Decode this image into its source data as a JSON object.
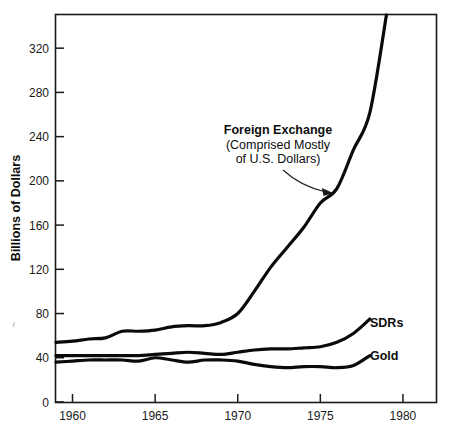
{
  "chart_data": {
    "type": "line",
    "title": "",
    "xlabel": "",
    "ylabel": "Billions of Dollars",
    "xlim": [
      1959,
      1982
    ],
    "ylim": [
      0,
      350
    ],
    "grid": false,
    "legend_position": "inline-right",
    "x_ticks": [
      "1960",
      "1965",
      "1970",
      "1975",
      "1980"
    ],
    "x_tick_values": [
      1960,
      1965,
      1970,
      1975,
      1980
    ],
    "y_ticks": [
      "0",
      "40",
      "80",
      "120",
      "160",
      "200",
      "240",
      "280",
      "320"
    ],
    "y_tick_values": [
      0,
      40,
      80,
      120,
      160,
      200,
      240,
      280,
      320
    ],
    "annotations": [
      {
        "name": "foreign-exchange-callout",
        "title": "Foreign Exchange",
        "line2": "(Comprised Mostly",
        "line3": "of U.S. Dollars)",
        "points_to_year": 1976,
        "points_to_value": 193
      }
    ],
    "series": [
      {
        "name": "Foreign Exchange",
        "label": "Foreign Exchange",
        "color": "#0a0a0a",
        "x": [
          1959,
          1960,
          1961,
          1962,
          1963,
          1964,
          1965,
          1966,
          1967,
          1968,
          1969,
          1970,
          1971,
          1972,
          1973,
          1974,
          1975,
          1976,
          1977,
          1978,
          1979
        ],
        "values": [
          54,
          55,
          57,
          58,
          64,
          64,
          65,
          68,
          69,
          69,
          72,
          80,
          100,
          122,
          140,
          158,
          180,
          193,
          228,
          262,
          350
        ]
      },
      {
        "name": "SDRs",
        "label": "SDRs",
        "color": "#0a0a0a",
        "x": [
          1959,
          1960,
          1961,
          1962,
          1963,
          1964,
          1965,
          1966,
          1967,
          1968,
          1969,
          1970,
          1971,
          1972,
          1973,
          1974,
          1975,
          1976,
          1977,
          1978
        ],
        "values": [
          42,
          42,
          42,
          42,
          42,
          42,
          43,
          44,
          45,
          44,
          43,
          45,
          47,
          48,
          48,
          49,
          50,
          54,
          62,
          75
        ]
      },
      {
        "name": "Gold",
        "label": "Gold",
        "color": "#0a0a0a",
        "x": [
          1959,
          1960,
          1961,
          1962,
          1963,
          1964,
          1965,
          1966,
          1967,
          1968,
          1969,
          1970,
          1971,
          1972,
          1973,
          1974,
          1975,
          1976,
          1977,
          1978
        ],
        "values": [
          36,
          37,
          38,
          38,
          38,
          37,
          40,
          38,
          36,
          38,
          38,
          37,
          34,
          32,
          31,
          32,
          32,
          31,
          33,
          42
        ]
      }
    ]
  }
}
